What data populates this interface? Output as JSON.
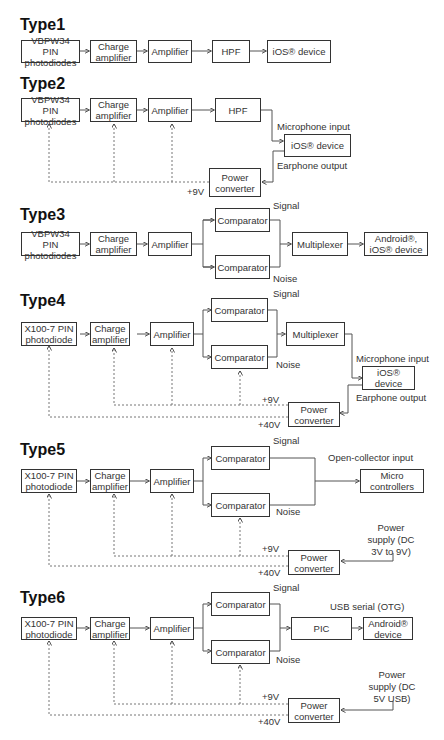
{
  "diagrams": [
    {
      "title": "Type1",
      "blocks": {
        "sensor": "VBPW34 PIN photodiodes",
        "charge_amp": "Charge amplifier",
        "amp": "Amplifier",
        "hpf": "HPF",
        "device": "iOS® device"
      }
    },
    {
      "title": "Type2",
      "blocks": {
        "sensor": "VBPW34 PIN photodiodes",
        "charge_amp": "Charge amplifier",
        "amp": "Amplifier",
        "hpf": "HPF",
        "device": "iOS® device",
        "power": "Power converter"
      },
      "labels": {
        "mic": "Microphone input",
        "ear": "Earphone output",
        "v9": "+9V"
      }
    },
    {
      "title": "Type3",
      "blocks": {
        "sensor": "VBPW34 PIN photodiodes",
        "charge_amp": "Charge amplifier",
        "amp": "Amplifier",
        "comp_signal": "Comparator",
        "comp_noise": "Comparator",
        "mux": "Multiplexer",
        "device": "Android®, iOS® device"
      },
      "labels": {
        "signal": "Signal",
        "noise": "Noise"
      }
    },
    {
      "title": "Type4",
      "blocks": {
        "sensor": "X100-7 PIN photodiode",
        "charge_amp": "Charge amplifier",
        "amp": "Amplifier",
        "comp_signal": "Comparator",
        "comp_noise": "Comparator",
        "mux": "Multiplexer",
        "device": "iOS® device",
        "power": "Power converter"
      },
      "labels": {
        "signal": "Signal",
        "noise": "Noise",
        "mic": "Microphone input",
        "ear": "Earphone output",
        "v9": "+9V",
        "v40": "+40V"
      }
    },
    {
      "title": "Type5",
      "blocks": {
        "sensor": "X100-7 PIN photodiode",
        "charge_amp": "Charge amplifier",
        "amp": "Amplifier",
        "comp_signal": "Comparator",
        "comp_noise": "Comparator",
        "mcu": "Micro controllers",
        "power": "Power converter"
      },
      "labels": {
        "signal": "Signal",
        "noise": "Noise",
        "oc": "Open-collector input",
        "supply": "Power supply (DC 3V to 9V)",
        "v9": "+9V",
        "v40": "+40V"
      }
    },
    {
      "title": "Type6",
      "blocks": {
        "sensor": "X100-7 PIN photodiode",
        "charge_amp": "Charge amplifier",
        "amp": "Amplifier",
        "comp_signal": "Comparator",
        "comp_noise": "Comparator",
        "pic": "PIC",
        "device": "Android® device",
        "power": "Power converter"
      },
      "labels": {
        "signal": "Signal",
        "noise": "Noise",
        "usb": "USB serial (OTG)",
        "supply": "Power supply (DC 5V USB)",
        "v9": "+9V",
        "v40": "+40V"
      }
    }
  ]
}
